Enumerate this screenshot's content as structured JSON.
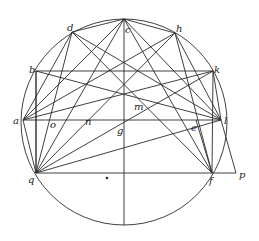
{
  "figure": {
    "type": "geometric-construction",
    "stroke_color": "#2a2a2a",
    "background": "#ffffff",
    "circle": {
      "cx": 124,
      "cy": 122,
      "r": 103
    },
    "points": {
      "a": {
        "x": 23,
        "y": 120,
        "label": "a",
        "lx": 13,
        "ly": 124
      },
      "b": {
        "x": 36,
        "y": 71,
        "label": "b",
        "lx": 29,
        "ly": 73
      },
      "d": {
        "x": 72,
        "y": 32,
        "label": "d",
        "lx": 67,
        "ly": 31
      },
      "c": {
        "x": 124,
        "y": 19,
        "label": "c",
        "lx": 125,
        "ly": 33
      },
      "h": {
        "x": 175,
        "y": 33,
        "label": "h",
        "lx": 176,
        "ly": 32
      },
      "k": {
        "x": 213,
        "y": 71,
        "label": "k",
        "lx": 214,
        "ly": 73
      },
      "l": {
        "x": 221,
        "y": 120,
        "label": "l",
        "lx": 224,
        "ly": 124
      },
      "e": {
        "x": 196,
        "y": 120,
        "label": "e",
        "lx": 191,
        "ly": 131
      },
      "g": {
        "x": 124,
        "y": 120,
        "label": "g",
        "lx": 117,
        "ly": 134
      },
      "o": {
        "x": 44,
        "y": 120,
        "label": "o",
        "lx": 50,
        "ly": 128
      },
      "n": {
        "x": 88,
        "y": 102,
        "label": "n",
        "lx": 85,
        "ly": 125
      },
      "m": {
        "x": 138,
        "y": 90,
        "label": "m",
        "lx": 134,
        "ly": 110
      },
      "q": {
        "x": 36,
        "y": 173,
        "label": "q",
        "lx": 28,
        "ly": 183
      },
      "f": {
        "x": 212,
        "y": 173,
        "label": "f",
        "lx": 209,
        "ly": 184
      },
      "p": {
        "x": 236,
        "y": 173,
        "label": "p",
        "lx": 239,
        "ly": 178
      }
    },
    "labels": [
      "a",
      "b",
      "c",
      "d",
      "e",
      "f",
      "g",
      "h",
      "k",
      "l",
      "m",
      "n",
      "o",
      "p",
      "q"
    ],
    "segments": [
      [
        "c",
        "bottom"
      ],
      [
        "a",
        "l"
      ],
      [
        "q",
        "p"
      ],
      [
        "b",
        "q"
      ],
      [
        "k",
        "f"
      ],
      [
        "l",
        "p"
      ],
      [
        "e",
        "f"
      ],
      [
        "q",
        "d"
      ],
      [
        "q",
        "c"
      ],
      [
        "q",
        "h"
      ],
      [
        "q",
        "k"
      ],
      [
        "q",
        "l"
      ],
      [
        "q",
        "a"
      ],
      [
        "q",
        "b"
      ],
      [
        "l",
        "d"
      ],
      [
        "l",
        "c"
      ],
      [
        "l",
        "h"
      ],
      [
        "l",
        "k"
      ],
      [
        "l",
        "b"
      ],
      [
        "a",
        "d"
      ],
      [
        "a",
        "c"
      ],
      [
        "a",
        "h"
      ],
      [
        "a",
        "k"
      ],
      [
        "b",
        "k"
      ],
      [
        "d",
        "f"
      ],
      [
        "c",
        "f"
      ],
      [
        "h",
        "f"
      ],
      [
        "d",
        "c"
      ],
      [
        "c",
        "h"
      ]
    ],
    "center_mark": {
      "x": 107,
      "y": 178
    }
  }
}
